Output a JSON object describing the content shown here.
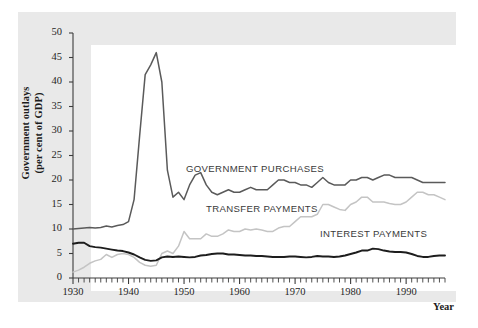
{
  "figure": {
    "axis_title_y": "Government outlays",
    "axis_title_y2": "(per cent of GDP)",
    "axis_title_x": "Year",
    "panel_color": "#e9e9e9",
    "plot_color": "#ffffff"
  },
  "labels": {
    "government_purchases": "GOVERNMENT PURCHASES",
    "transfer_payments": "TRANSFER PAYMENTS",
    "interest_payments": "INTEREST PAYMENTS"
  },
  "chart_data": {
    "type": "line",
    "title": "",
    "subtitle": "",
    "xlabel": "Year",
    "ylabel": "Government outlays (per cent of GDP)",
    "xlim": [
      1930,
      1997
    ],
    "ylim": [
      0,
      50
    ],
    "ytick_labels": [
      "0",
      "5",
      "10",
      "15",
      "20",
      "25",
      "30",
      "35",
      "40",
      "45",
      "50"
    ],
    "ytick_values": [
      0,
      5,
      10,
      15,
      20,
      25,
      30,
      35,
      40,
      45,
      50
    ],
    "xtick_labels": [
      "1930",
      "1940",
      "1950",
      "1960",
      "1970",
      "1980",
      "1990"
    ],
    "xtick_values": [
      1930,
      1940,
      1950,
      1960,
      1970,
      1980,
      1990
    ],
    "minor_xticks_every": 1,
    "grid": false,
    "legend_position": "inline-annotations",
    "colors": {
      "government_purchases": "#5a5a5a",
      "transfer_payments": "#c4c4c4",
      "interest_payments": "#1d1d1d"
    },
    "x": [
      1930,
      1931,
      1932,
      1933,
      1934,
      1935,
      1936,
      1937,
      1938,
      1939,
      1940,
      1941,
      1942,
      1943,
      1944,
      1945,
      1946,
      1947,
      1948,
      1949,
      1950,
      1951,
      1952,
      1953,
      1954,
      1955,
      1956,
      1957,
      1958,
      1959,
      1960,
      1961,
      1962,
      1963,
      1964,
      1965,
      1966,
      1967,
      1968,
      1969,
      1970,
      1971,
      1972,
      1973,
      1974,
      1975,
      1976,
      1977,
      1978,
      1979,
      1980,
      1981,
      1982,
      1983,
      1984,
      1985,
      1986,
      1987,
      1988,
      1989,
      1990,
      1991,
      1992,
      1993,
      1994,
      1995,
      1996,
      1997
    ],
    "series": [
      {
        "name": "GOVERNMENT PURCHASES",
        "color": "#5a5a5a",
        "values": [
          10.0,
          10.1,
          10.2,
          10.3,
          10.2,
          10.3,
          10.6,
          10.4,
          10.7,
          10.9,
          11.5,
          16.0,
          29.0,
          41.5,
          43.5,
          46.0,
          40.0,
          22.0,
          16.5,
          17.5,
          16.0,
          19.0,
          21.0,
          21.5,
          19.0,
          17.5,
          17.0,
          17.5,
          18.0,
          17.5,
          17.5,
          18.0,
          18.5,
          18.0,
          18.0,
          18.0,
          19.0,
          20.0,
          20.0,
          19.5,
          19.5,
          19.0,
          19.0,
          18.5,
          19.5,
          20.5,
          19.5,
          19.0,
          19.0,
          19.0,
          20.0,
          20.0,
          20.5,
          20.5,
          20.0,
          20.5,
          21.0,
          21.0,
          20.5,
          20.5,
          20.5,
          20.5,
          20.0,
          19.5,
          19.5,
          19.5,
          19.5,
          19.5
        ]
      },
      {
        "name": "TRANSFER PAYMENTS",
        "color": "#c4c4c4",
        "values": [
          1.2,
          1.6,
          2.2,
          3.0,
          3.5,
          3.8,
          4.8,
          4.2,
          4.8,
          5.0,
          4.8,
          4.2,
          3.2,
          2.6,
          2.4,
          2.6,
          5.0,
          5.5,
          5.0,
          6.5,
          9.5,
          8.0,
          8.0,
          8.0,
          9.0,
          8.5,
          8.5,
          9.0,
          9.8,
          9.5,
          9.5,
          10.0,
          9.8,
          10.0,
          9.8,
          9.5,
          9.5,
          10.2,
          10.5,
          10.5,
          11.5,
          12.5,
          12.5,
          12.5,
          13.0,
          15.0,
          15.0,
          14.5,
          14.0,
          13.8,
          15.0,
          15.5,
          16.5,
          16.5,
          15.5,
          15.5,
          15.5,
          15.2,
          15.0,
          15.0,
          15.5,
          16.5,
          17.5,
          17.5,
          17.0,
          17.0,
          16.5,
          16.0
        ]
      },
      {
        "name": "INTEREST PAYMENTS",
        "color": "#1d1d1d",
        "values": [
          7.0,
          7.2,
          7.2,
          6.5,
          6.3,
          6.2,
          6.0,
          5.8,
          5.6,
          5.5,
          5.2,
          4.8,
          4.2,
          3.7,
          3.5,
          3.6,
          4.2,
          4.4,
          4.3,
          4.4,
          4.3,
          4.2,
          4.3,
          4.6,
          4.7,
          4.9,
          5.0,
          5.0,
          4.8,
          4.8,
          4.7,
          4.6,
          4.6,
          4.5,
          4.5,
          4.4,
          4.3,
          4.3,
          4.3,
          4.4,
          4.4,
          4.3,
          4.2,
          4.3,
          4.5,
          4.4,
          4.4,
          4.3,
          4.4,
          4.6,
          4.9,
          5.2,
          5.6,
          5.6,
          6.0,
          5.9,
          5.6,
          5.4,
          5.3,
          5.3,
          5.2,
          4.9,
          4.5,
          4.3,
          4.3,
          4.5,
          4.6,
          4.6
        ]
      }
    ]
  }
}
